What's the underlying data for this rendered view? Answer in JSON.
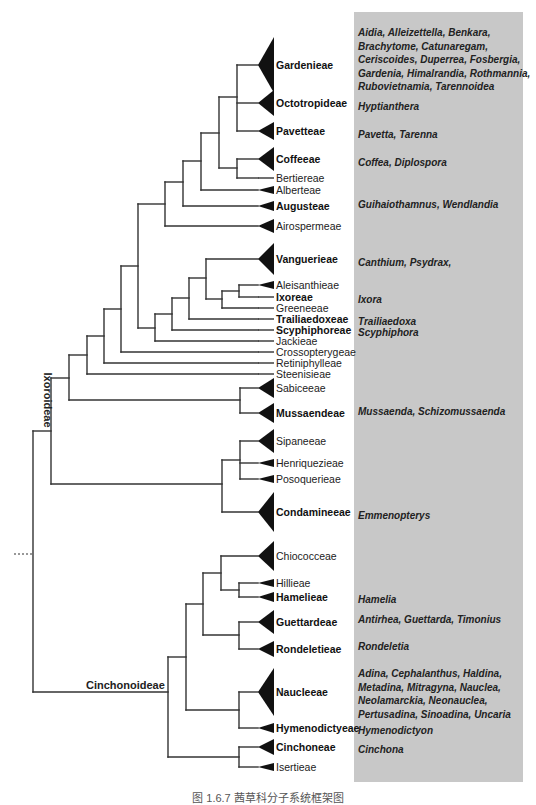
{
  "colors": {
    "line": "#333333",
    "triangle": "#111111",
    "genera_box": "#c8c8c8",
    "text": "#222222"
  },
  "genera_box": {
    "x": 354,
    "y": 12,
    "width": 169,
    "height": 770
  },
  "subfamilies": [
    {
      "id": "ixoroideae",
      "label": "Ixoroideae",
      "x": 44,
      "y": 400,
      "rotate": 90
    },
    {
      "id": "cinchonoideae",
      "label": "Cinchonoideae",
      "x": 86,
      "y": 689,
      "rotate": 0
    }
  ],
  "tips": [
    {
      "id": "gardenieae",
      "label": "Gardenieae",
      "bold": true,
      "y": 65,
      "tri": 28,
      "genera": [
        "Aidia, Alleizettella, Benkara,",
        "Brachytome, Catunaregam,",
        "Ceriscoides, Duperrea, Fosbergia,",
        "Gardenia, Himalrandia, Rothmannia,",
        "Rubovietnamia, Tarennoidea"
      ],
      "genera_y": 32
    },
    {
      "id": "octotropideae",
      "label": "Octotropideae",
      "bold": true,
      "y": 103,
      "tri": 13,
      "genera": [
        "Hyptianthera"
      ],
      "genera_y": 106
    },
    {
      "id": "pavetteae",
      "label": "Pavetteae",
      "bold": true,
      "y": 131,
      "tri": 9,
      "genera": [
        "Pavetta, Tarenna"
      ],
      "genera_y": 134
    },
    {
      "id": "coffeeae",
      "label": "Coffeeae",
      "bold": true,
      "y": 159,
      "tri": 12,
      "genera": [
        "Coffea, Diplospora"
      ],
      "genera_y": 162
    },
    {
      "id": "bertiereae",
      "label": "Bertiereae",
      "bold": false,
      "y": 178,
      "tri": 0,
      "genera": [],
      "genera_y": 0
    },
    {
      "id": "alberteae",
      "label": "Alberteae",
      "bold": false,
      "y": 190,
      "tri": 4,
      "genera": [],
      "genera_y": 0
    },
    {
      "id": "augusteae",
      "label": "Augusteae",
      "bold": true,
      "y": 206,
      "tri": 5,
      "genera": [
        "Guihaiothamnus, Wendlandia"
      ],
      "genera_y": 204
    },
    {
      "id": "airospermeae",
      "label": "Airospermeae",
      "bold": false,
      "y": 226,
      "tri": 7,
      "genera": [],
      "genera_y": 0
    },
    {
      "id": "vanguerieae",
      "label": "Vanguerieae",
      "bold": true,
      "y": 259,
      "tri": 16,
      "genera": [
        "Canthium, Psydrax,"
      ],
      "genera_y": 262
    },
    {
      "id": "aleisanthieae",
      "label": "Aleisanthieae",
      "bold": false,
      "y": 285,
      "tri": 4,
      "genera": [],
      "genera_y": 0
    },
    {
      "id": "ixoreae",
      "label": "Ixoreae",
      "bold": true,
      "y": 297,
      "tri": 0,
      "genera": [
        "Ixora"
      ],
      "genera_y": 299
    },
    {
      "id": "greeneeae",
      "label": "Greeneeae",
      "bold": false,
      "y": 308,
      "tri": 0,
      "genera": [],
      "genera_y": 0
    },
    {
      "id": "trailiaedoxeae",
      "label": "Trailiaedoxeae",
      "bold": true,
      "y": 319,
      "tri": 0,
      "genera": [
        "Trailiaedoxa"
      ],
      "genera_y": 321
    },
    {
      "id": "scyphiphoreae",
      "label": "Scyphiphoreae",
      "bold": true,
      "y": 330,
      "tri": 0,
      "genera": [
        "Scyphiphora"
      ],
      "genera_y": 332
    },
    {
      "id": "jackieae",
      "label": "Jackieae",
      "bold": false,
      "y": 341,
      "tri": 0,
      "genera": [],
      "genera_y": 0
    },
    {
      "id": "crossopterygeae",
      "label": "Crossopterygeae",
      "bold": false,
      "y": 352,
      "tri": 0,
      "genera": [],
      "genera_y": 0
    },
    {
      "id": "retiniphylleae",
      "label": "Retiniphylleae",
      "bold": false,
      "y": 363,
      "tri": 0,
      "genera": [],
      "genera_y": 0
    },
    {
      "id": "steenisieae",
      "label": "Steenisieae",
      "bold": false,
      "y": 374,
      "tri": 0,
      "genera": [],
      "genera_y": 0
    },
    {
      "id": "sabiceeae",
      "label": "Sabiceeae",
      "bold": false,
      "y": 388,
      "tri": 10,
      "genera": [],
      "genera_y": 0
    },
    {
      "id": "mussaendeae",
      "label": "Mussaendeae",
      "bold": true,
      "y": 413,
      "tri": 10,
      "genera": [
        "Mussaenda, Schizomussaenda"
      ],
      "genera_y": 411
    },
    {
      "id": "sipaneeae",
      "label": "Sipaneeae",
      "bold": false,
      "y": 441,
      "tri": 12,
      "genera": [],
      "genera_y": 0
    },
    {
      "id": "henriquezieae",
      "label": "Henriquezieae",
      "bold": false,
      "y": 463,
      "tri": 4,
      "genera": [],
      "genera_y": 0
    },
    {
      "id": "posoquerieae",
      "label": "Posoquerieae",
      "bold": false,
      "y": 479,
      "tri": 4,
      "genera": [],
      "genera_y": 0
    },
    {
      "id": "condamineeae",
      "label": "Condamineeae",
      "bold": true,
      "y": 512,
      "tri": 20,
      "genera": [
        "Emmenopterys"
      ],
      "genera_y": 515
    },
    {
      "id": "chiococceae",
      "label": "Chiococceae",
      "bold": false,
      "y": 556,
      "tri": 15,
      "genera": [],
      "genera_y": 0
    },
    {
      "id": "hillieae",
      "label": "Hillieae",
      "bold": false,
      "y": 583,
      "tri": 4,
      "genera": [],
      "genera_y": 0
    },
    {
      "id": "hamelieae",
      "label": "Hamelieae",
      "bold": true,
      "y": 597,
      "tri": 5,
      "genera": [
        "Hamelia"
      ],
      "genera_y": 599
    },
    {
      "id": "guettardeae",
      "label": "Guettardeae",
      "bold": true,
      "y": 622,
      "tri": 12,
      "genera": [
        "Antirhea, Guettarda, Timonius"
      ],
      "genera_y": 619
    },
    {
      "id": "rondeletieae",
      "label": "Rondeletieae",
      "bold": true,
      "y": 649,
      "tri": 8,
      "genera": [
        "Rondeletia"
      ],
      "genera_y": 646
    },
    {
      "id": "naucleeae",
      "label": "Naucleeae",
      "bold": true,
      "y": 692,
      "tri": 24,
      "genera": [
        "Adina, Cephalanthus, Haldina,",
        "Metadina, Mitragyna, Nauclea,",
        "Neolamarckia, Neonauclea,",
        "Pertusadina, Sinoadina, Uncaria"
      ],
      "genera_y": 673
    },
    {
      "id": "hymenodictyeae",
      "label": "Hymenodictyeae",
      "bold": true,
      "y": 728,
      "tri": 5,
      "genera": [
        "Hymenodictyon"
      ],
      "genera_y": 730
    },
    {
      "id": "cinchoneae",
      "label": "Cinchoneae",
      "bold": true,
      "y": 747,
      "tri": 8,
      "genera": [
        "Cinchona"
      ],
      "genera_y": 749
    },
    {
      "id": "isertieae",
      "label": "Isertieae",
      "bold": false,
      "y": 767,
      "tri": 4,
      "genera": [],
      "genera_y": 0
    }
  ],
  "branches": [
    [
      237,
      65,
      258,
      65
    ],
    [
      237,
      103,
      258,
      103
    ],
    [
      237,
      65,
      237,
      131
    ],
    [
      237,
      131,
      258,
      131
    ],
    [
      219,
      97,
      237,
      97
    ],
    [
      237,
      159,
      258,
      159
    ],
    [
      237,
      178,
      258,
      178
    ],
    [
      237,
      159,
      237,
      178
    ],
    [
      219,
      168,
      237,
      168
    ],
    [
      219,
      97,
      219,
      168
    ],
    [
      201,
      133,
      219,
      133
    ],
    [
      201,
      190,
      258,
      190
    ],
    [
      201,
      133,
      201,
      190
    ],
    [
      183,
      161,
      201,
      161
    ],
    [
      183,
      206,
      258,
      206
    ],
    [
      183,
      161,
      183,
      206
    ],
    [
      165,
      182,
      183,
      182
    ],
    [
      165,
      226,
      258,
      226
    ],
    [
      165,
      182,
      165,
      226
    ],
    [
      239,
      285,
      258,
      285
    ],
    [
      239,
      297,
      258,
      297
    ],
    [
      239,
      285,
      239,
      297
    ],
    [
      222,
      291,
      239,
      291
    ],
    [
      222,
      308,
      258,
      308
    ],
    [
      222,
      291,
      222,
      308
    ],
    [
      206,
      259,
      258,
      259
    ],
    [
      206,
      299,
      222,
      299
    ],
    [
      206,
      259,
      206,
      299
    ],
    [
      189,
      278,
      206,
      278
    ],
    [
      189,
      319,
      258,
      319
    ],
    [
      189,
      278,
      189,
      319
    ],
    [
      172,
      298,
      189,
      298
    ],
    [
      172,
      330,
      258,
      330
    ],
    [
      172,
      298,
      172,
      330
    ],
    [
      155,
      314,
      172,
      314
    ],
    [
      155,
      341,
      258,
      341
    ],
    [
      155,
      314,
      155,
      341
    ],
    [
      138,
      204,
      165,
      204
    ],
    [
      138,
      328,
      155,
      328
    ],
    [
      138,
      204,
      138,
      328
    ],
    [
      121,
      266,
      138,
      266
    ],
    [
      121,
      352,
      258,
      352
    ],
    [
      121,
      266,
      121,
      352
    ],
    [
      104,
      309,
      121,
      309
    ],
    [
      104,
      363,
      258,
      363
    ],
    [
      104,
      309,
      104,
      363
    ],
    [
      87,
      336,
      104,
      336
    ],
    [
      87,
      374,
      258,
      374
    ],
    [
      87,
      336,
      87,
      374
    ],
    [
      240,
      388,
      258,
      388
    ],
    [
      240,
      413,
      258,
      413
    ],
    [
      240,
      388,
      240,
      413
    ],
    [
      69,
      355,
      87,
      355
    ],
    [
      69,
      400,
      240,
      400
    ],
    [
      69,
      355,
      69,
      400
    ],
    [
      240,
      441,
      258,
      441
    ],
    [
      240,
      463,
      258,
      463
    ],
    [
      240,
      479,
      258,
      479
    ],
    [
      240,
      441,
      240,
      479
    ],
    [
      222,
      460,
      240,
      460
    ],
    [
      222,
      512,
      258,
      512
    ],
    [
      222,
      460,
      222,
      512
    ],
    [
      51,
      378,
      69,
      378
    ],
    [
      51,
      484,
      222,
      484
    ],
    [
      51,
      378,
      51,
      484
    ],
    [
      239,
      583,
      258,
      583
    ],
    [
      239,
      597,
      258,
      597
    ],
    [
      239,
      583,
      239,
      597
    ],
    [
      221,
      556,
      258,
      556
    ],
    [
      221,
      590,
      239,
      590
    ],
    [
      221,
      556,
      221,
      590
    ],
    [
      239,
      622,
      258,
      622
    ],
    [
      239,
      649,
      258,
      649
    ],
    [
      239,
      622,
      239,
      649
    ],
    [
      203,
      573,
      221,
      573
    ],
    [
      203,
      635,
      239,
      635
    ],
    [
      203,
      573,
      203,
      635
    ],
    [
      239,
      692,
      258,
      692
    ],
    [
      239,
      728,
      258,
      728
    ],
    [
      239,
      692,
      239,
      728
    ],
    [
      186,
      604,
      203,
      604
    ],
    [
      186,
      710,
      239,
      710
    ],
    [
      186,
      604,
      186,
      710
    ],
    [
      239,
      747,
      258,
      747
    ],
    [
      239,
      767,
      258,
      767
    ],
    [
      239,
      747,
      239,
      767
    ],
    [
      168,
      657,
      186,
      657
    ],
    [
      168,
      757,
      239,
      757
    ],
    [
      168,
      657,
      168,
      757
    ],
    [
      33,
      431,
      51,
      431
    ],
    [
      33,
      692,
      168,
      692
    ],
    [
      33,
      431,
      33,
      692
    ]
  ],
  "root_dash": {
    "x1": 14,
    "y1": 554,
    "x2": 33,
    "y2": 554
  },
  "layout": {
    "tri_base_x": 258,
    "tri_tip_width": 16,
    "label_x": 276,
    "genera_x": 358
  },
  "caption": "图 1.6.7  茜草科分子系统框架图"
}
